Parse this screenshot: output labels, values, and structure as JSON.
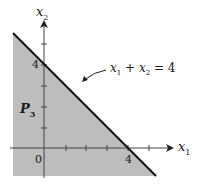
{
  "diagram": {
    "axes": {
      "x_label": "x",
      "x_sub": "1",
      "y_label": "x",
      "y_sub": "2"
    },
    "line_label": {
      "a": "x",
      "a_sub": "1",
      "plus": " + ",
      "b": "x",
      "b_sub": "2",
      "eq": " = 4"
    },
    "region_label": {
      "main": "P",
      "sub": "3"
    },
    "ticks": {
      "x_four": "4",
      "y_four": "4",
      "origin": "0"
    },
    "colors": {
      "region": "#bdbdbd",
      "line": "#111111",
      "axis": "#333333"
    }
  }
}
